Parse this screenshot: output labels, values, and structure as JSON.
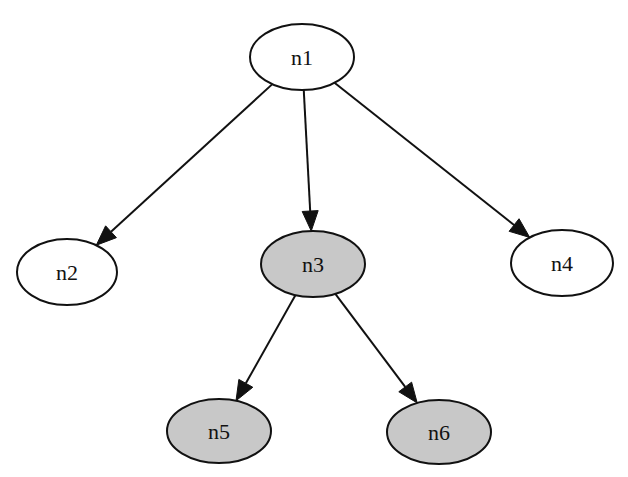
{
  "diagram": {
    "type": "directed-tree",
    "colors": {
      "background": "#ffffff",
      "stroke": "#111111",
      "unfilled_node": "#ffffff",
      "filled_node": "#c8c8c8"
    },
    "nodes": [
      {
        "id": "n1",
        "label": "n1",
        "cx": 302,
        "cy": 57,
        "rx": 52,
        "ry": 33,
        "filled": false
      },
      {
        "id": "n2",
        "label": "n2",
        "cx": 67,
        "cy": 272,
        "rx": 50,
        "ry": 33,
        "filled": false
      },
      {
        "id": "n3",
        "label": "n3",
        "cx": 313,
        "cy": 264,
        "rx": 52,
        "ry": 33,
        "filled": true
      },
      {
        "id": "n4",
        "label": "n4",
        "cx": 562,
        "cy": 263,
        "rx": 51,
        "ry": 33,
        "filled": false
      },
      {
        "id": "n5",
        "label": "n5",
        "cx": 219,
        "cy": 431,
        "rx": 52,
        "ry": 32,
        "filled": true
      },
      {
        "id": "n6",
        "label": "n6",
        "cx": 439,
        "cy": 432,
        "rx": 52,
        "ry": 32,
        "filled": true
      }
    ],
    "edges": [
      {
        "from": "n1",
        "to": "n2"
      },
      {
        "from": "n1",
        "to": "n3"
      },
      {
        "from": "n1",
        "to": "n4"
      },
      {
        "from": "n3",
        "to": "n5"
      },
      {
        "from": "n3",
        "to": "n6"
      }
    ]
  }
}
